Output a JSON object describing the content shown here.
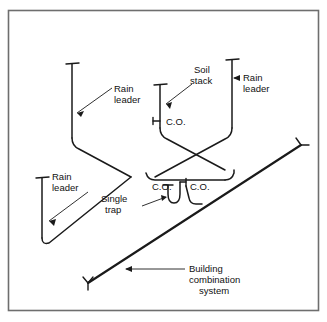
{
  "figure": {
    "border_color": "#6e6e6e",
    "line_color": "#1a1a1a",
    "background_color": "#ffffff",
    "text_color": "#111111"
  },
  "labels": {
    "rain_leader_left_top_line1": "Rain",
    "rain_leader_left_top_line2": "leader",
    "rain_leader_lower_left_line1": "Rain",
    "rain_leader_lower_left_line2": "leader",
    "rain_leader_right_line1": "Rain",
    "rain_leader_right_line2": "leader",
    "soil_stack_line1": "Soil",
    "soil_stack_line2": "stack",
    "cleanout_stack": "C.O.",
    "cleanout_main": "C.O.",
    "cleanout_trap": "C.O.",
    "single_trap_line1": "Single",
    "single_trap_line2": "trap",
    "building_system_line1": "Building",
    "building_system_line2": "combination",
    "building_system_line3": "system"
  }
}
